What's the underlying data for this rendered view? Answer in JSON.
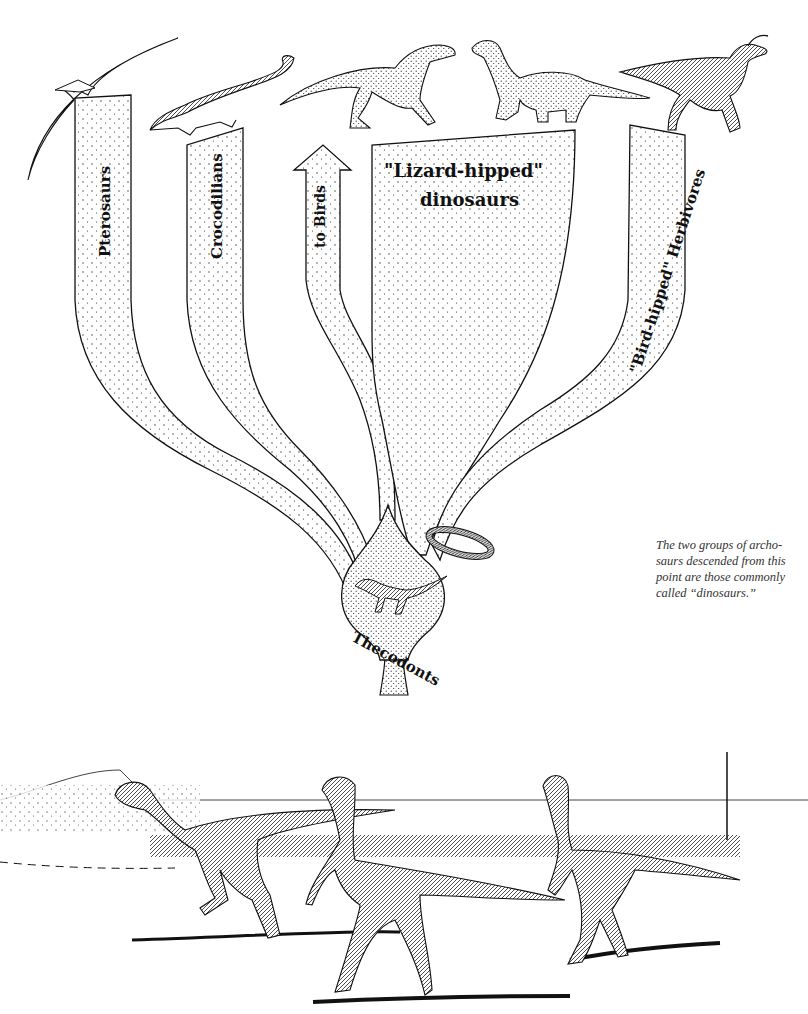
{
  "figure": {
    "type": "phylogenetic-tree-illustration",
    "root": {
      "label": "Thecodonts"
    },
    "branches": [
      {
        "id": "pterosaurs",
        "label": "Pterosaurs",
        "animal": "pterosaur"
      },
      {
        "id": "crocodilians",
        "label": "Crocodilians",
        "animal": "crocodile"
      },
      {
        "id": "birds",
        "label": "to Birds",
        "animal": "arrow"
      },
      {
        "id": "lizard-hipped",
        "label_line1": "\"Lizard-hipped\"",
        "label_line2": "dinosaurs",
        "animals": [
          "theropod",
          "sauropod"
        ]
      },
      {
        "id": "bird-hipped",
        "label": "\"Bird-hipped\" Herbivores",
        "animal": "hadrosaur"
      }
    ],
    "caption": {
      "lines": [
        "The two groups of archo-",
        "saurs descended from this",
        "point are those commonly",
        "called “dinosaurs.”"
      ]
    }
  },
  "scene": {
    "description": "Three bipedal early dinosaurs walking across a plain with vegetation in background",
    "animal_count": 3
  },
  "colors": {
    "ink": "#111111",
    "paper": "#ffffff",
    "caption_text": "#333333"
  }
}
